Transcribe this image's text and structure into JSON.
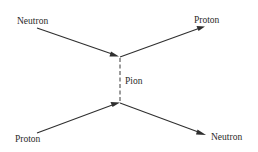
{
  "diagram": {
    "type": "feynman-diagram",
    "nodes": {
      "top_left": {
        "label": "Neutron"
      },
      "top_right": {
        "label": "Proton"
      },
      "exchange": {
        "label": "Pion"
      },
      "bottom_left": {
        "label": "Proton"
      },
      "bottom_right": {
        "label": "Neutron"
      }
    },
    "edges": [
      {
        "from": "Neutron (in)",
        "to": "top vertex",
        "style": "solid-arrow"
      },
      {
        "from": "top vertex",
        "to": "Proton (out)",
        "style": "solid-arrow"
      },
      {
        "from": "top vertex",
        "to": "bottom vertex",
        "style": "dashed",
        "label": "Pion"
      },
      {
        "from": "Proton (in)",
        "to": "bottom vertex",
        "style": "solid-arrow"
      },
      {
        "from": "bottom vertex",
        "to": "Neutron (out)",
        "style": "solid-arrow"
      }
    ],
    "colors": {
      "line": "#2f2f2f",
      "text": "#2a2a2a",
      "background": "#ffffff"
    }
  }
}
